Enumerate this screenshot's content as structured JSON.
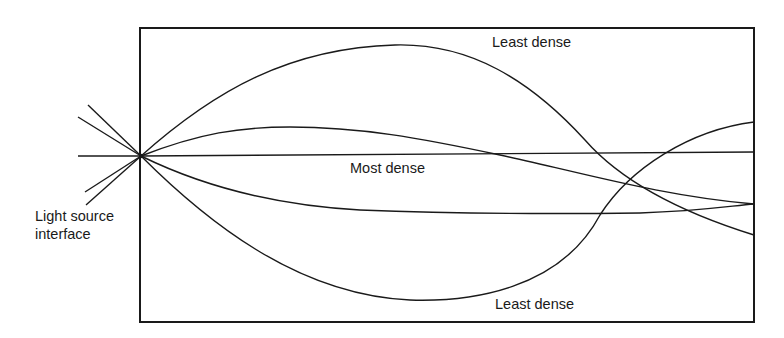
{
  "diagram": {
    "type": "optical fiber / graded-index light ray propagation",
    "labels": {
      "least_dense_top": "Least dense",
      "most_dense": "Most dense",
      "least_dense_bottom": "Least dense",
      "light_source_line1": "Light source",
      "light_source_line2": "interface"
    },
    "colors": {
      "line": "#1a1a1a",
      "background": "#ffffff"
    },
    "box": {
      "x": 140,
      "y": 28,
      "width": 614,
      "height": 294
    },
    "focal_point": {
      "x": 141,
      "y": 156
    },
    "rays": [
      {
        "name": "upper-outer-ray",
        "end_y": 235
      },
      {
        "name": "upper-inner-ray",
        "end_y": 204
      },
      {
        "name": "axial-ray",
        "end_y": 152
      },
      {
        "name": "lower-inner-ray",
        "end_y": 204
      },
      {
        "name": "lower-outer-ray",
        "end_y": 122
      }
    ]
  }
}
